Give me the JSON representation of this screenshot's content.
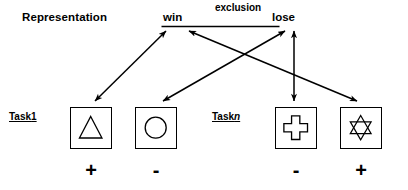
{
  "figure": {
    "title": "Representation",
    "background_color": "#ffffff",
    "stroke_color": "#000000"
  },
  "outcome_nodes": {
    "win": "win",
    "lose": "lose",
    "relation_label": "exclusion"
  },
  "tasks": [
    {
      "id": "task-1",
      "label_text": "Task",
      "label_index": "1"
    },
    {
      "id": "task-n",
      "label_text": "Task",
      "label_index": "n"
    }
  ],
  "stimuli": [
    {
      "id": "triangle",
      "icon": "triangle-icon",
      "sign": "+",
      "task": "Task 1",
      "linked_outcome": "win"
    },
    {
      "id": "circle",
      "icon": "circle-icon",
      "sign": "-",
      "task": "Task 1",
      "linked_outcome": "lose"
    },
    {
      "id": "cross",
      "icon": "cross-icon",
      "sign": "-",
      "task": "Task n",
      "linked_outcome": "lose"
    },
    {
      "id": "star",
      "icon": "star-of-david-icon",
      "sign": "+",
      "task": "Task n",
      "linked_outcome": "win"
    }
  ],
  "connections": [
    {
      "from": "triangle",
      "to": "win",
      "arrow": "double"
    },
    {
      "from": "circle",
      "to": "lose",
      "arrow": "double"
    },
    {
      "from": "cross",
      "to": "lose",
      "arrow": "double"
    },
    {
      "from": "star",
      "to": "win",
      "arrow": "double"
    }
  ]
}
